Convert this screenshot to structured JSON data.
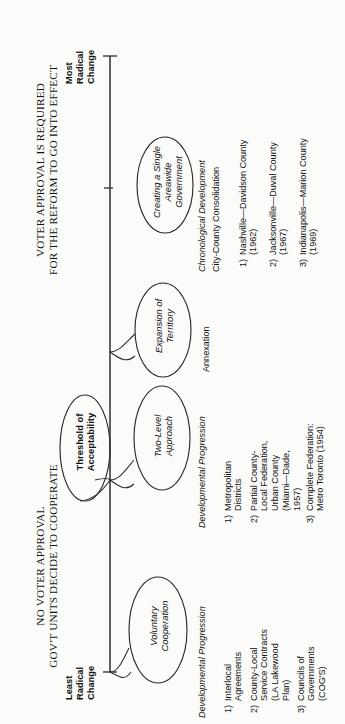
{
  "diagram": {
    "title_left": {
      "line1": "NO VOTER APPROVAL",
      "line2": "GOV'T UNITS DECIDE TO COOPERATE"
    },
    "title_right": {
      "line1": "VOTER APPROVAL IS REQUIRED",
      "line2": "FOR THE REFORM TO GO INTO EFFECT"
    },
    "axis": {
      "start_label": "Least\nRadical\nChange",
      "end_label": "Most\nRadical\nChange"
    },
    "threshold_label": "Threshold of\nAcceptability",
    "stages": [
      {
        "oval": "Voluntary\nCooperation",
        "list_header": "Developmental Progression",
        "subheader": "",
        "items": [
          {
            "num": "1)",
            "text": "Interlocal\nAgreements"
          },
          {
            "num": "2)",
            "text": "County-Local\nService Contracts\n(LA Lakewood\nPlan)"
          },
          {
            "num": "3)",
            "text": "Councils of\nGovernments\n(COG'S)"
          }
        ]
      },
      {
        "oval": "Two-Level\nApproach",
        "list_header": "Developmental Progression",
        "subheader": "",
        "items": [
          {
            "num": "1)",
            "text": "Metropolitan\nDistricts"
          },
          {
            "num": "2)",
            "text": "Partial County-\nLocal Federation,\nUrban County\n(Miami—Dade,\n1957)"
          },
          {
            "num": "3)",
            "text": "Complete Federation:\nMetro Toronto (1954)"
          }
        ]
      },
      {
        "oval": "Expansion of\nTerritory",
        "list_header": "",
        "subheader": "",
        "items": [
          {
            "num": "",
            "text": "Annexation"
          }
        ]
      },
      {
        "oval": "Creating a Single\nAreawide\nGovernment",
        "list_header": "Chronological Development",
        "subheader": "City-County Consolidation",
        "items": [
          {
            "num": "1)",
            "text": "Nashville—Davidson County\n(1962)"
          },
          {
            "num": "2)",
            "text": "Jacksonville—Duval County\n(1967)"
          },
          {
            "num": "3)",
            "text": "Indianapolis—Marion County\n(1969)"
          }
        ]
      }
    ]
  }
}
